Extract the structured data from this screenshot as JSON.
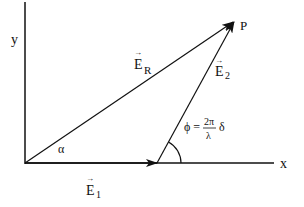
{
  "diagram": {
    "type": "phasor vector addition",
    "axes": {
      "x_label": "x",
      "y_label": "y"
    },
    "vectors": [
      {
        "id": "E1",
        "label": "E",
        "subscript": "1",
        "arrow": "→"
      },
      {
        "id": "E2",
        "label": "E",
        "subscript": "2",
        "arrow": "→"
      },
      {
        "id": "ER",
        "label": "E",
        "subscript": "R",
        "arrow": "→"
      }
    ],
    "point_label": "P",
    "angle_alpha": "α",
    "phase_equation": {
      "lhs": "ϕ =",
      "numerator": "2π",
      "denominator": "λ",
      "trailing": "δ"
    },
    "colors": {
      "stroke": "#111111",
      "background": "#ffffff"
    }
  }
}
